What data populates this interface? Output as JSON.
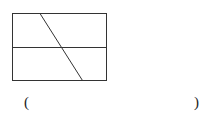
{
  "figure": {
    "stroke_color": "#333333"
  },
  "answer_blank": {
    "left_paren": "(",
    "right_paren": ")",
    "value": ""
  }
}
